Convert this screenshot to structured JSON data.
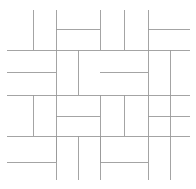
{
  "figure": {
    "width": 196,
    "height": 189,
    "background_color": "#ffffff",
    "line_color": "#9a9a9a",
    "line_width": 0.9
  },
  "chart_data": {
    "type": "diagram",
    "grid_x": [
      33,
      56,
      78,
      100,
      124,
      148,
      170
    ],
    "grid_y": [
      50,
      72,
      95,
      116,
      136,
      162
    ],
    "segments": [
      {
        "name": "v-top-1",
        "x1": 33,
        "y1": 10,
        "x2": 33,
        "y2": 50
      },
      {
        "name": "v-top-2",
        "x1": 56,
        "y1": 10,
        "x2": 56,
        "y2": 95
      },
      {
        "name": "v-top-3",
        "x1": 100,
        "y1": 10,
        "x2": 100,
        "y2": 50
      },
      {
        "name": "v-top-4",
        "x1": 124,
        "y1": 10,
        "x2": 124,
        "y2": 50
      },
      {
        "name": "v-top-5",
        "x1": 148,
        "y1": 10,
        "x2": 148,
        "y2": 95
      },
      {
        "name": "h-top-1",
        "x1": 56,
        "y1": 29,
        "x2": 100,
        "y2": 29
      },
      {
        "name": "h-top-2",
        "x1": 148,
        "y1": 29,
        "x2": 190,
        "y2": 29
      },
      {
        "name": "h-row1-L",
        "x1": 7,
        "y1": 50,
        "x2": 100,
        "y2": 50
      },
      {
        "name": "h-row1-R",
        "x1": 100,
        "y1": 50,
        "x2": 190,
        "y2": 50
      },
      {
        "name": "v-r2-a",
        "x1": 78,
        "y1": 50,
        "x2": 78,
        "y2": 95
      },
      {
        "name": "v-r2-b",
        "x1": 170,
        "y1": 50,
        "x2": 170,
        "y2": 136
      },
      {
        "name": "h-row2-1",
        "x1": 7,
        "y1": 72,
        "x2": 56,
        "y2": 72
      },
      {
        "name": "h-row2-2",
        "x1": 100,
        "y1": 72,
        "x2": 148,
        "y2": 72
      },
      {
        "name": "h-row3-L",
        "x1": 7,
        "y1": 95,
        "x2": 100,
        "y2": 95
      },
      {
        "name": "h-row3-R",
        "x1": 100,
        "y1": 95,
        "x2": 190,
        "y2": 95
      },
      {
        "name": "v-r3-a",
        "x1": 33,
        "y1": 95,
        "x2": 33,
        "y2": 136
      },
      {
        "name": "v-r3-b",
        "x1": 56,
        "y1": 95,
        "x2": 56,
        "y2": 162
      },
      {
        "name": "v-r3-c",
        "x1": 100,
        "y1": 95,
        "x2": 100,
        "y2": 162
      },
      {
        "name": "v-r3-d",
        "x1": 124,
        "y1": 95,
        "x2": 124,
        "y2": 136
      },
      {
        "name": "v-r3-e",
        "x1": 148,
        "y1": 95,
        "x2": 148,
        "y2": 136
      },
      {
        "name": "h-row4-1",
        "x1": 56,
        "y1": 116,
        "x2": 100,
        "y2": 116
      },
      {
        "name": "h-row4-2",
        "x1": 148,
        "y1": 116,
        "x2": 190,
        "y2": 116
      },
      {
        "name": "h-row5-L",
        "x1": 7,
        "y1": 136,
        "x2": 100,
        "y2": 136
      },
      {
        "name": "h-row5-R",
        "x1": 100,
        "y1": 136,
        "x2": 190,
        "y2": 136
      },
      {
        "name": "v-bot-1",
        "x1": 56,
        "y1": 136,
        "x2": 56,
        "y2": 180
      },
      {
        "name": "v-bot-2",
        "x1": 78,
        "y1": 136,
        "x2": 78,
        "y2": 180
      },
      {
        "name": "v-bot-3",
        "x1": 100,
        "y1": 136,
        "x2": 100,
        "y2": 180
      },
      {
        "name": "v-bot-4",
        "x1": 148,
        "y1": 136,
        "x2": 148,
        "y2": 180
      },
      {
        "name": "v-bot-5",
        "x1": 170,
        "y1": 136,
        "x2": 170,
        "y2": 180
      },
      {
        "name": "h-bot-1",
        "x1": 7,
        "y1": 162,
        "x2": 56,
        "y2": 162
      },
      {
        "name": "h-bot-2",
        "x1": 100,
        "y1": 162,
        "x2": 148,
        "y2": 162
      }
    ]
  }
}
